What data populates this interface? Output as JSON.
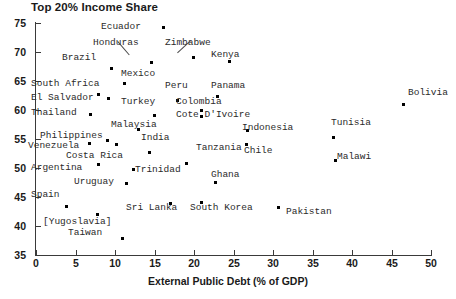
{
  "chart_data": {
    "type": "scatter",
    "title": "Top 20% Income Share",
    "xlabel": "External Public Debt (% of GDP)",
    "ylabel": "",
    "xlim": [
      0,
      50
    ],
    "ylim": [
      35,
      75
    ],
    "xticks": [
      0,
      5,
      10,
      15,
      20,
      25,
      30,
      35,
      40,
      45,
      50
    ],
    "yticks": [
      35,
      40,
      45,
      50,
      55,
      60,
      65,
      70,
      75
    ],
    "grid": false,
    "legend": "none",
    "points": [
      {
        "label": "Ecuador",
        "x": 16.2,
        "y": 74.2,
        "lx": 101,
        "ly": 22,
        "la": "right",
        "leader": false
      },
      {
        "label": "Honduras",
        "x": 14.6,
        "y": 68.2,
        "lx": 93,
        "ly": 38,
        "la": "left",
        "leader": true
      },
      {
        "label": "Zimbabwe",
        "x": 19.9,
        "y": 69.0,
        "lx": 165,
        "ly": 38,
        "la": "left",
        "leader": true
      },
      {
        "label": "Kenya",
        "x": 24.5,
        "y": 68.4,
        "lx": 211,
        "ly": 50,
        "la": "left",
        "leader": false
      },
      {
        "label": "Brazil",
        "x": 9.6,
        "y": 67.2,
        "lx": 62,
        "ly": 53,
        "la": "left",
        "leader": false
      },
      {
        "label": "Mexico",
        "x": 11.2,
        "y": 64.6,
        "lx": 121,
        "ly": 69,
        "la": "left",
        "leader": false
      },
      {
        "label": "South Africa",
        "x": 7.9,
        "y": 62.6,
        "lx": 31,
        "ly": 79,
        "la": "left",
        "leader": false
      },
      {
        "label": "Peru",
        "x": 17.9,
        "y": 61.7,
        "lx": 165,
        "ly": 81,
        "la": "left",
        "leader": false
      },
      {
        "label": "Panama",
        "x": 23.0,
        "y": 62.4,
        "lx": 211,
        "ly": 81,
        "la": "left",
        "leader": false
      },
      {
        "label": "El Salvador",
        "x": 9.2,
        "y": 62.0,
        "lx": 31,
        "ly": 93,
        "la": "left",
        "leader": false
      },
      {
        "label": "Turkey",
        "x": 15.0,
        "y": 59.0,
        "lx": 121,
        "ly": 97,
        "la": "left",
        "leader": false
      },
      {
        "label": "Colombia",
        "x": 21.0,
        "y": 60.0,
        "lx": 176,
        "ly": 97,
        "la": "left",
        "leader": false
      },
      {
        "label": "Bolivia",
        "x": 46.5,
        "y": 61.0,
        "lx": 408,
        "ly": 88,
        "la": "left",
        "leader": false
      },
      {
        "label": "Thailand",
        "x": 6.9,
        "y": 59.2,
        "lx": 31,
        "ly": 108,
        "la": "left",
        "leader": false
      },
      {
        "label": "Malaysia",
        "x": 13.0,
        "y": 56.7,
        "lx": 111,
        "ly": 120,
        "la": "left",
        "leader": false
      },
      {
        "label": "Cote D'Ivoire",
        "x": 21.0,
        "y": 58.8,
        "lx": 176,
        "ly": 110,
        "la": "left",
        "leader": false
      },
      {
        "label": "Indonesia",
        "x": 26.8,
        "y": 56.5,
        "lx": 242,
        "ly": 123,
        "la": "left",
        "leader": false
      },
      {
        "label": "Tunisia",
        "x": 37.7,
        "y": 55.2,
        "lx": 331,
        "ly": 118,
        "la": "left",
        "leader": false
      },
      {
        "label": "Philippines",
        "x": 9.0,
        "y": 54.8,
        "lx": 40,
        "ly": 131,
        "la": "left",
        "leader": false
      },
      {
        "label": "India",
        "x": 14.4,
        "y": 52.6,
        "lx": 141,
        "ly": 133,
        "la": "left",
        "leader": false
      },
      {
        "label": "Venezuela",
        "x": 6.8,
        "y": 54.2,
        "lx": 28,
        "ly": 141,
        "la": "left",
        "leader": false
      },
      {
        "label": "Costa Rica",
        "x": 7.9,
        "y": 50.6,
        "lx": 66,
        "ly": 151,
        "la": "left",
        "leader": false
      },
      {
        "label": "Tanzania",
        "x": 19.0,
        "y": 50.8,
        "lx": 196,
        "ly": 143,
        "la": "left",
        "leader": false
      },
      {
        "label": "Chile",
        "x": 26.6,
        "y": 54.0,
        "lx": 244,
        "ly": 146,
        "la": "left",
        "leader": false
      },
      {
        "label": "Malawi",
        "x": 37.9,
        "y": 51.3,
        "lx": 337,
        "ly": 152,
        "la": "left",
        "leader": false
      },
      {
        "label": "Argentina",
        "x": 12.3,
        "y": 49.8,
        "lx": 31,
        "ly": 163,
        "la": "left",
        "leader": false
      },
      {
        "label": "Trinidad",
        "x": 11.4,
        "y": 47.4,
        "lx": 135,
        "ly": 165,
        "la": "left",
        "leader": false
      },
      {
        "label": "Ghana",
        "x": 22.7,
        "y": 47.5,
        "lx": 211,
        "ly": 170,
        "la": "left",
        "leader": false
      },
      {
        "label": "Uruguay",
        "x": 10.2,
        "y": 54.0,
        "lx": 74,
        "ly": 177,
        "la": "left",
        "leader": false
      },
      {
        "label": "Spain",
        "x": 3.9,
        "y": 43.3,
        "lx": 31,
        "ly": 190,
        "la": "left",
        "leader": false
      },
      {
        "label": "Sri Lanka",
        "x": 17.0,
        "y": 43.8,
        "lx": 126,
        "ly": 203,
        "la": "left",
        "leader": false
      },
      {
        "label": "South Korea",
        "x": 20.9,
        "y": 44.0,
        "lx": 190,
        "ly": 203,
        "la": "left",
        "leader": false
      },
      {
        "label": "Pakistan",
        "x": 30.7,
        "y": 43.2,
        "lx": 286,
        "ly": 207,
        "la": "left",
        "leader": false
      },
      {
        "label": "[Yugoslavia]",
        "x": 7.8,
        "y": 42.0,
        "lx": 43,
        "ly": 217,
        "la": "left",
        "leader": false
      },
      {
        "label": "Taiwan",
        "x": 11.0,
        "y": 37.9,
        "lx": 68,
        "ly": 228,
        "la": "left",
        "leader": false
      }
    ],
    "leaders": [
      {
        "name": "honduras-leader",
        "x1": 118,
        "y1": 41,
        "x2": 130,
        "y2": 55
      },
      {
        "name": "zimbabwe-leader",
        "x1": 191,
        "y1": 41,
        "x2": 178,
        "y2": 53
      }
    ]
  },
  "colors": {
    "point": "#000000",
    "axis": "#3a3a3a",
    "text": "#1a1a1a",
    "label_text": "#2b2b2b",
    "background": "#ffffff"
  }
}
